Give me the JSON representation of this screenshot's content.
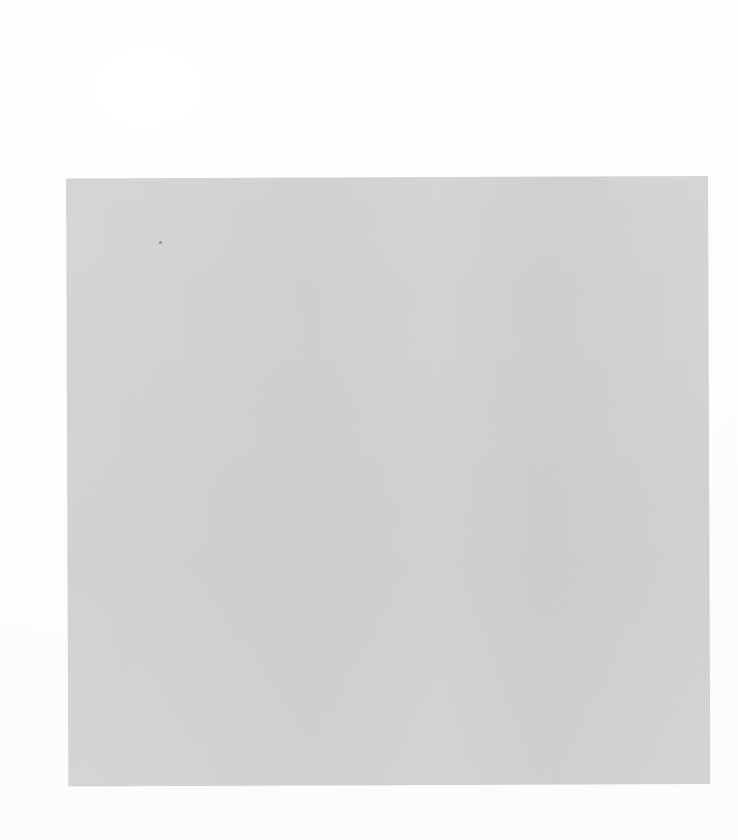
{
  "document": {
    "kind": "scanned-page",
    "state": "blank",
    "visible_text": "",
    "page_background_color": "#d3d4d5",
    "canvas_background_color": "#ffffff",
    "speck_color": "#5a5c5f",
    "region": {
      "left": 66,
      "top": 176,
      "width": 642,
      "height": 608,
      "skew_degrees": -0.22
    },
    "artifacts": [
      {
        "name": "dust-speck",
        "x": 159,
        "y": 241,
        "size": 3
      }
    ],
    "content_elements": []
  }
}
